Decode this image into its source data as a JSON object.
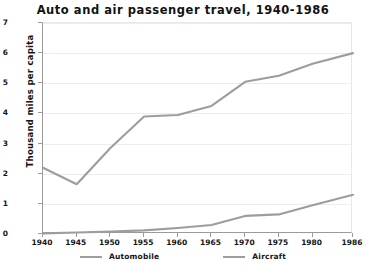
{
  "chart_data": {
    "type": "line",
    "title": "Auto and air passenger travel, 1940-1986",
    "xlabel": "",
    "ylabel": "Thousand miles per capita",
    "categories": [
      "1940",
      "1945",
      "1950",
      "1955",
      "1960",
      "1965",
      "1970",
      "1975",
      "1980",
      "1986"
    ],
    "x": [
      1940,
      1945,
      1950,
      1955,
      1960,
      1965,
      1970,
      1975,
      1980,
      1986
    ],
    "xlim": [
      1940,
      1986
    ],
    "ylim": [
      0,
      7
    ],
    "yticks": [
      0,
      1,
      2,
      3,
      4,
      5,
      6,
      7
    ],
    "grid": true,
    "legend_position": "bottom",
    "series": [
      {
        "name": "Automobile",
        "color": "#9d9d9d",
        "values": [
          2.2,
          1.65,
          2.85,
          3.9,
          3.95,
          4.25,
          5.05,
          5.25,
          5.65,
          6.0
        ]
      },
      {
        "name": "Aircraft",
        "color": "#9d9d9d",
        "values": [
          0.02,
          0.05,
          0.08,
          0.12,
          0.2,
          0.3,
          0.6,
          0.65,
          0.95,
          1.3
        ]
      }
    ]
  },
  "axis": {
    "y_title": "Thousand miles per capita"
  }
}
